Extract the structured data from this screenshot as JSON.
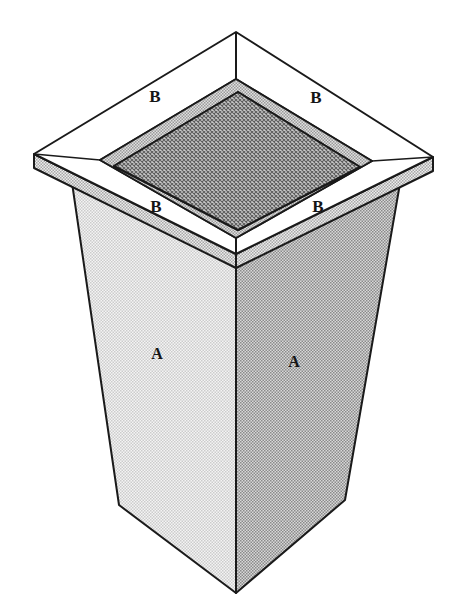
{
  "diagram": {
    "background_color": "#ffffff",
    "outline_color": "#1a1a1a"
  },
  "labels": {
    "flange": [
      {
        "id": "b-top-left",
        "text": "B",
        "x": 155,
        "y": 98,
        "size": 17
      },
      {
        "id": "b-top-right",
        "text": "B",
        "x": 316,
        "y": 99,
        "size": 17
      },
      {
        "id": "b-bottom-left",
        "text": "B",
        "x": 156,
        "y": 208,
        "size": 17
      },
      {
        "id": "b-bottom-right",
        "text": "B",
        "x": 318,
        "y": 208,
        "size": 17
      }
    ],
    "body": [
      {
        "id": "a-left-face",
        "text": "A",
        "x": 157,
        "y": 355,
        "size": 16
      },
      {
        "id": "a-right-face",
        "text": "A",
        "x": 294,
        "y": 363,
        "size": 16
      }
    ]
  },
  "geometry": {
    "flange_outer": {
      "top_apex": {
        "x": 236,
        "y": 32
      },
      "left_tip": {
        "x": 34,
        "y": 154
      },
      "right_tip": {
        "x": 433,
        "y": 157
      },
      "bottom_apex": {
        "x": 236,
        "y": 254
      }
    },
    "flange_thickness_px": 14,
    "opening_outer": {
      "top_apex": {
        "x": 236,
        "y": 79
      },
      "left_tip": {
        "x": 100,
        "y": 160
      },
      "right_tip": {
        "x": 372,
        "y": 161
      },
      "bottom_apex": {
        "x": 236,
        "y": 238
      }
    },
    "opening_inner": {
      "top_apex": {
        "x": 238,
        "y": 92
      },
      "left_tip": {
        "x": 114,
        "y": 166
      },
      "right_tip": {
        "x": 360,
        "y": 167
      },
      "bottom_apex": {
        "x": 238,
        "y": 230
      }
    },
    "body_top": {
      "left": {
        "x": 70,
        "y": 169
      },
      "front": {
        "x": 236,
        "y": 268
      },
      "right": {
        "x": 402,
        "y": 172
      }
    },
    "body_bottom": {
      "left": {
        "x": 119,
        "y": 505
      },
      "front": {
        "x": 236,
        "y": 593
      },
      "right": {
        "x": 345,
        "y": 500
      }
    }
  },
  "colors": {
    "flange_top_face": "#ffffff",
    "flange_edge_fill": "#cfcfcf",
    "opening_rim": "#c2c2c2",
    "opening_cavity": "#9c9c9c",
    "body_left_face": "#e4e4e4",
    "body_right_face": "#b2b2b2",
    "outline": "#1a1a1a",
    "label_color": "#151515"
  }
}
